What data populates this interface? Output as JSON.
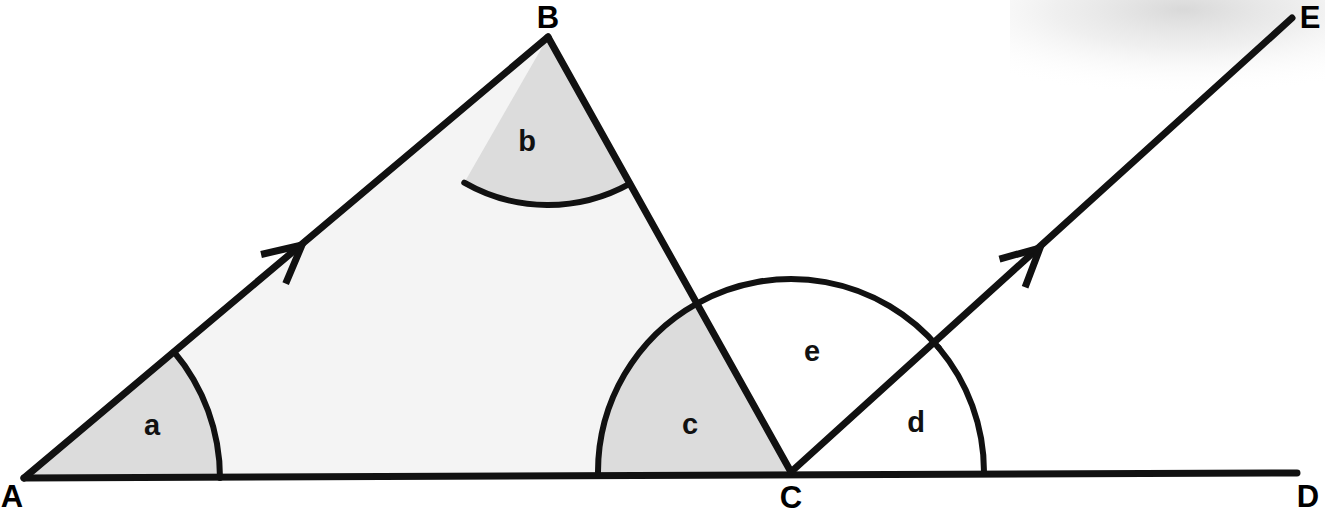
{
  "figure": {
    "background_color": "#ffffff",
    "stroke_color": "#111111",
    "triangle_fill": "#f4f4f4",
    "sector_shaded_fill": "#dcdcdc",
    "sector_open_fill": "#ffffff",
    "width": 1325,
    "height": 512
  },
  "vertices": [
    {
      "id": "A",
      "label": "A",
      "x": 24,
      "y": 478,
      "label_x": 12,
      "label_y": 496
    },
    {
      "id": "B",
      "label": "B",
      "x": 548,
      "y": 37,
      "label_x": 548,
      "label_y": 17
    },
    {
      "id": "C",
      "label": "C",
      "x": 791,
      "y": 472,
      "label_x": 791,
      "label_y": 497
    },
    {
      "id": "D",
      "label": "D",
      "x": 1297,
      "y": 473,
      "label_x": 1308,
      "label_y": 496
    },
    {
      "id": "E",
      "label": "E",
      "x": 1292,
      "y": 18,
      "label_x": 1310,
      "label_y": 17
    }
  ],
  "segments": [
    {
      "name": "segment-AB",
      "from": "A",
      "to": "B",
      "x1": 24,
      "y1": 478,
      "x2": 548,
      "y2": 37,
      "width": 7
    },
    {
      "name": "segment-BC",
      "from": "B",
      "to": "C",
      "x1": 548,
      "y1": 37,
      "x2": 791,
      "y2": 472,
      "width": 7
    },
    {
      "name": "segment-AD",
      "from": "A",
      "to": "D",
      "x1": 24,
      "y1": 478,
      "x2": 1297,
      "y2": 473,
      "width": 7
    },
    {
      "name": "ray-CE",
      "from": "C",
      "to": "E",
      "x1": 791,
      "y1": 472,
      "x2": 1292,
      "y2": 18,
      "width": 7
    }
  ],
  "direction_markers": [
    {
      "name": "arrow-marker-ab",
      "on": "segment-AB",
      "x": 302,
      "y": 245,
      "angle_deg": -40.1
    },
    {
      "name": "arrow-marker-ce",
      "on": "ray-CE",
      "x": 1040,
      "y": 248,
      "angle_deg": -42.2
    }
  ],
  "angles": [
    {
      "id": "a",
      "label": "a",
      "vertex": "A",
      "cx": 24,
      "cy": 478,
      "radius": 196,
      "start_deg": 0,
      "end_deg": 40.1,
      "shaded": true,
      "label_x": 152,
      "label_y": 425
    },
    {
      "id": "b",
      "label": "b",
      "vertex": "B",
      "cx": 548,
      "cy": 37,
      "radius": 168,
      "start_deg": 240.1,
      "end_deg": 299.2,
      "shaded": true,
      "label_x": 527,
      "label_y": 141
    },
    {
      "id": "c",
      "label": "c",
      "vertex": "C",
      "cx": 791,
      "cy": 472,
      "radius": 193,
      "start_deg": 119.2,
      "end_deg": 180,
      "shaded": true,
      "label_x": 690,
      "label_y": 424
    },
    {
      "id": "e",
      "label": "e",
      "vertex": "C",
      "cx": 791,
      "cy": 472,
      "radius": 193,
      "start_deg": 40.1,
      "end_deg": 119.2,
      "shaded": false,
      "label_x": 812,
      "label_y": 351
    },
    {
      "id": "d",
      "label": "d",
      "vertex": "C",
      "cx": 791,
      "cy": 472,
      "radius": 193,
      "start_deg": 0,
      "end_deg": 40.1,
      "shaded": false,
      "label_x": 916,
      "label_y": 422
    }
  ],
  "artifacts": [
    {
      "name": "scan-smudge-top-right",
      "x": 1010,
      "y": 0,
      "width": 315,
      "height": 95
    }
  ]
}
